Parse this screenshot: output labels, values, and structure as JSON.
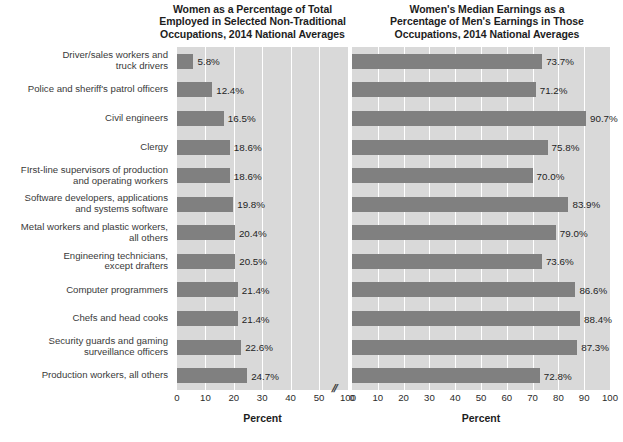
{
  "chart_data": [
    {
      "type": "bar",
      "orientation": "horizontal",
      "id": "left",
      "title": "Women as a Percentage of Total Employed in Selected Non-Traditional Occupations, 2014 National Averages",
      "title_lines": [
        "Women as a Percentage of Total",
        "Employed in Selected Non-Traditional",
        "Occupations, 2014 National Averages"
      ],
      "xlabel": "Percent",
      "ylabel": "",
      "xlim": [
        0,
        100
      ],
      "axis_break": {
        "present": true,
        "glyph": "//",
        "after": 50,
        "before": 100
      },
      "ticks": [
        "0",
        "10",
        "20",
        "30",
        "40",
        "50",
        "100"
      ],
      "tick_values": [
        0,
        10,
        20,
        30,
        40,
        50,
        100
      ],
      "grid": true,
      "legend": "none",
      "categories": [
        "Driver/sales workers and\ntruck drivers",
        "Police and sheriff's patrol officers",
        "Civil engineers",
        "Clergy",
        "FIrst-line supervisors of production\nand operating workers",
        "Software developers, applications\nand systems software",
        "Metal workers and plastic workers,\nall others",
        "Engineering technicians,\nexcept drafters",
        "Computer programmers",
        "Chefs and head cooks",
        "Security guards and gaming\nsurveillance officers",
        "Production workers, all others"
      ],
      "values": [
        5.8,
        12.4,
        16.5,
        18.6,
        18.6,
        19.8,
        20.4,
        20.5,
        21.4,
        21.4,
        22.6,
        24.7
      ],
      "data_labels": [
        "5.8%",
        "12.4%",
        "16.5%",
        "18.6%",
        "18.6%",
        "19.8%",
        "20.4%",
        "20.5%",
        "21.4%",
        "21.4%",
        "22.6%",
        "24.7%"
      ]
    },
    {
      "type": "bar",
      "orientation": "horizontal",
      "id": "right",
      "title": "Women's Median Earnings as a Percentage of Men's Earnings in Those Occupations, 2014 National Averages",
      "title_lines": [
        "Women's Median Earnings as a",
        "Percentage of Men's Earnings in Those",
        "Occupations, 2014 National Averages"
      ],
      "xlabel": "Percent",
      "ylabel": "",
      "xlim": [
        0,
        100
      ],
      "axis_break": {
        "present": false
      },
      "ticks": [
        "0",
        "10",
        "20",
        "30",
        "40",
        "50",
        "60",
        "70",
        "80",
        "90",
        "100"
      ],
      "tick_values": [
        0,
        10,
        20,
        30,
        40,
        50,
        60,
        70,
        80,
        90,
        100
      ],
      "grid": true,
      "legend": "none",
      "categories": [
        "Driver/sales workers and\ntruck drivers",
        "Police and sheriff's patrol officers",
        "Civil engineers",
        "Clergy",
        "FIrst-line supervisors of production\nand operating workers",
        "Software developers, applications\nand systems software",
        "Metal workers and plastic workers,\nall others",
        "Engineering technicians,\nexcept drafters",
        "Computer programmers",
        "Chefs and head cooks",
        "Security guards and gaming\nsurveillance officers",
        "Production workers, all others"
      ],
      "values": [
        73.7,
        71.2,
        90.7,
        75.8,
        70.0,
        83.9,
        79.0,
        73.6,
        86.6,
        88.4,
        87.3,
        72.8
      ],
      "data_labels": [
        "73.7%",
        "71.2%",
        "90.7%",
        "75.8%",
        "70.0%",
        "83.9%",
        "79.0%",
        "73.6%",
        "86.6%",
        "88.4%",
        "87.3%",
        "72.8%"
      ]
    }
  ],
  "colors": {
    "bar": "#808080",
    "plot_background": "#d9d9d9",
    "gridline": "#ffffff",
    "page_background": "#ffffff",
    "text": "#2b2b2b"
  }
}
